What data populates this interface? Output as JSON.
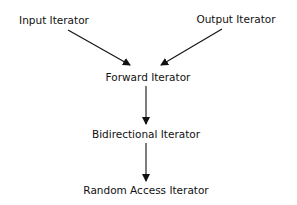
{
  "diagram": {
    "nodes": [
      {
        "id": "input",
        "label": "Input Iterator"
      },
      {
        "id": "output",
        "label": "Output Iterator"
      },
      {
        "id": "forward",
        "label": "Forward Iterator"
      },
      {
        "id": "bidirectional",
        "label": "Bidirectional Iterator"
      },
      {
        "id": "random",
        "label": "Random Access Iterator"
      }
    ],
    "edges": [
      {
        "from": "input",
        "to": "forward"
      },
      {
        "from": "output",
        "to": "forward"
      },
      {
        "from": "forward",
        "to": "bidirectional"
      },
      {
        "from": "bidirectional",
        "to": "random"
      }
    ],
    "colors": {
      "text": "#111111",
      "arrow": "#111111",
      "background": "#ffffff"
    }
  }
}
